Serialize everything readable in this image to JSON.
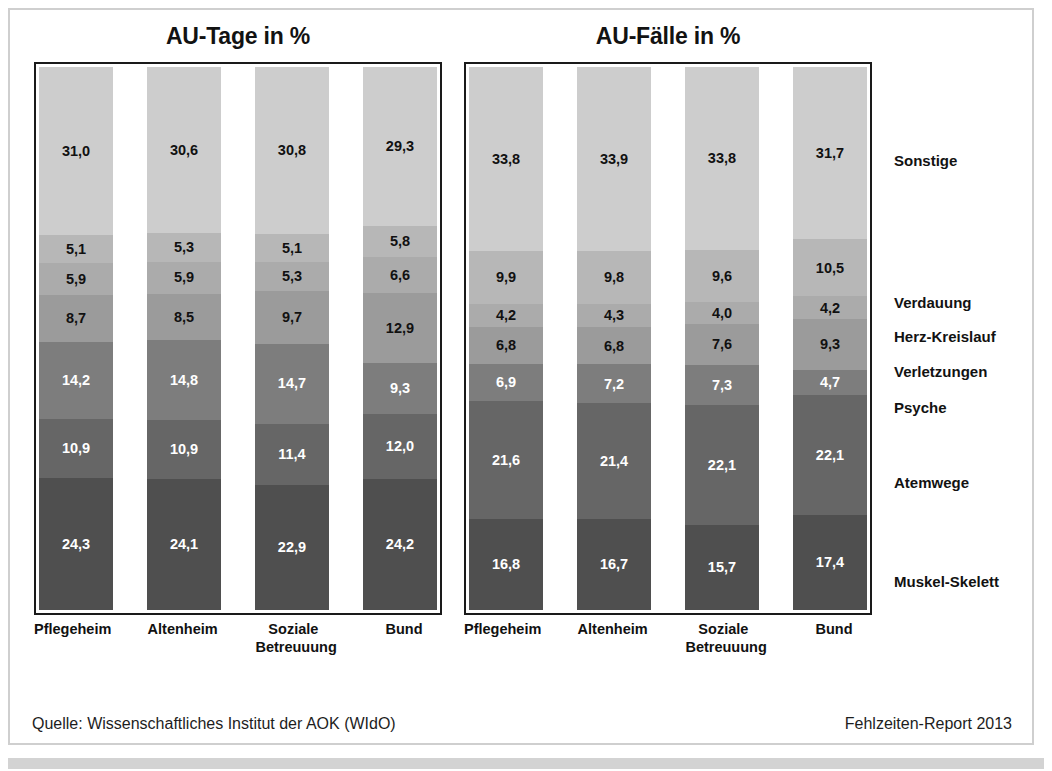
{
  "chart_data": [
    {
      "type": "bar",
      "title": "AU-Tage in %",
      "stacked": true,
      "xlabel": "",
      "ylabel": "",
      "ylim": [
        0,
        100
      ],
      "grid": false,
      "legend_position": "right",
      "categories": [
        "Pflegeheim",
        "Altenheim",
        "Soziale Betreuuung",
        "Bund"
      ],
      "series": [
        {
          "name": "Muskel-Skelett",
          "values": [
            24.3,
            24.1,
            22.9,
            24.2
          ]
        },
        {
          "name": "Atemwege",
          "values": [
            10.9,
            10.9,
            11.4,
            12.0
          ]
        },
        {
          "name": "Psyche",
          "values": [
            14.2,
            14.8,
            14.7,
            9.3
          ]
        },
        {
          "name": "Verletzungen",
          "values": [
            8.7,
            8.5,
            9.7,
            12.9
          ]
        },
        {
          "name": "Herz-Kreislauf",
          "values": [
            5.9,
            5.9,
            5.3,
            6.6
          ]
        },
        {
          "name": "Verdauung",
          "values": [
            5.1,
            5.3,
            5.1,
            5.8
          ]
        },
        {
          "name": "Sonstige",
          "values": [
            31.0,
            30.6,
            30.8,
            29.3
          ]
        }
      ]
    },
    {
      "type": "bar",
      "title": "AU-Fälle in %",
      "stacked": true,
      "xlabel": "",
      "ylabel": "",
      "ylim": [
        0,
        100
      ],
      "grid": false,
      "legend_position": "right",
      "categories": [
        "Pflegeheim",
        "Altenheim",
        "Soziale Betreuuung",
        "Bund"
      ],
      "series": [
        {
          "name": "Muskel-Skelett",
          "values": [
            16.8,
            16.7,
            15.7,
            17.4
          ]
        },
        {
          "name": "Atemwege",
          "values": [
            21.6,
            21.4,
            22.1,
            22.1
          ]
        },
        {
          "name": "Psyche",
          "values": [
            6.9,
            7.2,
            7.3,
            4.7
          ]
        },
        {
          "name": "Verletzungen",
          "values": [
            6.8,
            6.8,
            7.6,
            9.3
          ]
        },
        {
          "name": "Herz-Kreislauf",
          "values": [
            4.2,
            4.3,
            4.0,
            4.2
          ]
        },
        {
          "name": "Verdauung",
          "values": [
            9.9,
            9.8,
            9.6,
            10.5
          ]
        },
        {
          "name": "Sonstige",
          "values": [
            33.8,
            33.9,
            33.8,
            31.7
          ]
        }
      ]
    }
  ],
  "panels": {
    "tage": {
      "title": "AU-Tage in %",
      "bars": [
        {
          "label_line1": "Pflegeheim",
          "label_line2": "",
          "segments": [
            {
              "name": "Sonstige",
              "value": "31,0",
              "pct": 31.0
            },
            {
              "name": "Verdauung",
              "value": "5,1",
              "pct": 5.1
            },
            {
              "name": "Herz-Kreislauf",
              "value": "5,9",
              "pct": 5.9
            },
            {
              "name": "Verletzungen",
              "value": "8,7",
              "pct": 8.7
            },
            {
              "name": "Psyche",
              "value": "14,2",
              "pct": 14.2
            },
            {
              "name": "Atemwege",
              "value": "10,9",
              "pct": 10.9
            },
            {
              "name": "Muskel-Skelett",
              "value": "24,3",
              "pct": 24.3
            }
          ]
        },
        {
          "label_line1": "Altenheim",
          "label_line2": "",
          "segments": [
            {
              "name": "Sonstige",
              "value": "30,6",
              "pct": 30.6
            },
            {
              "name": "Verdauung",
              "value": "5,3",
              "pct": 5.3
            },
            {
              "name": "Herz-Kreislauf",
              "value": "5,9",
              "pct": 5.9
            },
            {
              "name": "Verletzungen",
              "value": "8,5",
              "pct": 8.5
            },
            {
              "name": "Psyche",
              "value": "14,8",
              "pct": 14.8
            },
            {
              "name": "Atemwege",
              "value": "10,9",
              "pct": 10.9
            },
            {
              "name": "Muskel-Skelett",
              "value": "24,1",
              "pct": 24.1
            }
          ]
        },
        {
          "label_line1": "Soziale",
          "label_line2": "Betreuuung",
          "segments": [
            {
              "name": "Sonstige",
              "value": "30,8",
              "pct": 30.8
            },
            {
              "name": "Verdauung",
              "value": "5,1",
              "pct": 5.1
            },
            {
              "name": "Herz-Kreislauf",
              "value": "5,3",
              "pct": 5.3
            },
            {
              "name": "Verletzungen",
              "value": "9,7",
              "pct": 9.7
            },
            {
              "name": "Psyche",
              "value": "14,7",
              "pct": 14.7
            },
            {
              "name": "Atemwege",
              "value": "11,4",
              "pct": 11.4
            },
            {
              "name": "Muskel-Skelett",
              "value": "22,9",
              "pct": 22.9
            }
          ]
        },
        {
          "label_line1": "Bund",
          "label_line2": "",
          "segments": [
            {
              "name": "Sonstige",
              "value": "29,3",
              "pct": 29.3
            },
            {
              "name": "Verdauung",
              "value": "5,8",
              "pct": 5.8
            },
            {
              "name": "Herz-Kreislauf",
              "value": "6,6",
              "pct": 6.6
            },
            {
              "name": "Verletzungen",
              "value": "12,9",
              "pct": 12.9
            },
            {
              "name": "Psyche",
              "value": "9,3",
              "pct": 9.3
            },
            {
              "name": "Atemwege",
              "value": "12,0",
              "pct": 12.0
            },
            {
              "name": "Muskel-Skelett",
              "value": "24,2",
              "pct": 24.2
            }
          ]
        }
      ]
    },
    "faelle": {
      "title": "AU-Fälle in %",
      "bars": [
        {
          "label_line1": "Pflegeheim",
          "label_line2": "",
          "segments": [
            {
              "name": "Sonstige",
              "value": "33,8",
              "pct": 33.8
            },
            {
              "name": "Verdauung",
              "value": "9,9",
              "pct": 9.9
            },
            {
              "name": "Herz-Kreislauf",
              "value": "4,2",
              "pct": 4.2
            },
            {
              "name": "Verletzungen",
              "value": "6,8",
              "pct": 6.8
            },
            {
              "name": "Psyche",
              "value": "6,9",
              "pct": 6.9
            },
            {
              "name": "Atemwege",
              "value": "21,6",
              "pct": 21.6
            },
            {
              "name": "Muskel-Skelett",
              "value": "16,8",
              "pct": 16.8
            }
          ]
        },
        {
          "label_line1": "Altenheim",
          "label_line2": "",
          "segments": [
            {
              "name": "Sonstige",
              "value": "33,9",
              "pct": 33.9
            },
            {
              "name": "Verdauung",
              "value": "9,8",
              "pct": 9.8
            },
            {
              "name": "Herz-Kreislauf",
              "value": "4,3",
              "pct": 4.3
            },
            {
              "name": "Verletzungen",
              "value": "6,8",
              "pct": 6.8
            },
            {
              "name": "Psyche",
              "value": "7,2",
              "pct": 7.2
            },
            {
              "name": "Atemwege",
              "value": "21,4",
              "pct": 21.4
            },
            {
              "name": "Muskel-Skelett",
              "value": "16,7",
              "pct": 16.7
            }
          ]
        },
        {
          "label_line1": "Soziale",
          "label_line2": "Betreuuung",
          "segments": [
            {
              "name": "Sonstige",
              "value": "33,8",
              "pct": 33.8
            },
            {
              "name": "Verdauung",
              "value": "9,6",
              "pct": 9.6
            },
            {
              "name": "Herz-Kreislauf",
              "value": "4,0",
              "pct": 4.0
            },
            {
              "name": "Verletzungen",
              "value": "7,6",
              "pct": 7.6
            },
            {
              "name": "Psyche",
              "value": "7,3",
              "pct": 7.3
            },
            {
              "name": "Atemwege",
              "value": "22,1",
              "pct": 22.1
            },
            {
              "name": "Muskel-Skelett",
              "value": "15,7",
              "pct": 15.7
            }
          ]
        },
        {
          "label_line1": "Bund",
          "label_line2": "",
          "segments": [
            {
              "name": "Sonstige",
              "value": "31,7",
              "pct": 31.7
            },
            {
              "name": "Verdauung",
              "value": "10,5",
              "pct": 10.5
            },
            {
              "name": "Herz-Kreislauf",
              "value": "4,2",
              "pct": 4.2
            },
            {
              "name": "Verletzungen",
              "value": "9,3",
              "pct": 9.3
            },
            {
              "name": "Psyche",
              "value": "4,7",
              "pct": 4.7
            },
            {
              "name": "Atemwege",
              "value": "22,1",
              "pct": 22.1
            },
            {
              "name": "Muskel-Skelett",
              "value": "17,4",
              "pct": 17.4
            }
          ]
        }
      ]
    }
  },
  "legend": {
    "items": [
      {
        "label": "Sonstige",
        "top": 90,
        "color": "#cdcdcd"
      },
      {
        "label": "Verdauung",
        "top": 232,
        "color": "#b7b7b7"
      },
      {
        "label": "Herz-Kreislauf",
        "top": 266,
        "color": "#ababab"
      },
      {
        "label": "Verletzungen",
        "top": 301,
        "color": "#9b9b9b"
      },
      {
        "label": "Psyche",
        "top": 337,
        "color": "#7d7d7d"
      },
      {
        "label": "Atemwege",
        "top": 412,
        "color": "#666666"
      },
      {
        "label": "Muskel-Skelett",
        "top": 511,
        "color": "#4f4f4f"
      }
    ]
  },
  "footer": {
    "source": "Quelle: Wissenschaftliches Institut der AOK (WIdO)",
    "report": "Fehlzeiten-Report 2013"
  },
  "colors": {
    "sonstige": "#cdcdcd",
    "verdauung": "#b7b7b7",
    "herz_kreislauf": "#ababab",
    "verletzungen": "#9b9b9b",
    "psyche": "#7d7d7d",
    "atemwege": "#666666",
    "muskel_skelett": "#4f4f4f",
    "frame": "#cfcfcf",
    "plot_border": "#1a1a1a",
    "bottom_band": "#d3d3d3"
  }
}
